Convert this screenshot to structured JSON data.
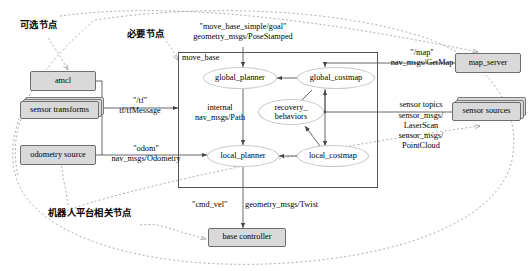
{
  "diagram": {
    "colors": {
      "node_fill": "#d9d9d9",
      "node_border": "#6e6e6e",
      "ellipse_border": "#c9c9c9",
      "line": "#555555",
      "dashed": "#9a9a9a"
    }
  },
  "annotations": {
    "optional_nodes": "可选节点",
    "required_nodes": "必要节点",
    "platform_nodes": "机器人平台相关节点"
  },
  "container": {
    "label": "move_base"
  },
  "nodes": {
    "amcl": "amcl",
    "sensor_transforms": "sensor transforms",
    "odometry_source": "odometry source",
    "map_server": "map_server",
    "sensor_sources": "sensor sources",
    "base_controller": "base controller"
  },
  "components": {
    "global_planner": "global_planner",
    "global_costmap": "global_costmap",
    "recovery_behaviors": "recovery_\nbehaviors",
    "recovery_behaviors_l1": "recovery_",
    "recovery_behaviors_l2": "behaviors",
    "local_planner": "local_planner",
    "local_costmap": "local_costmap"
  },
  "topics": {
    "goal_name": "\"move_base_simple/goal\"",
    "goal_type": "geometry_msgs/PoseStamped",
    "tf_name": "\"/tf\"",
    "tf_type": "tf/tfMessage",
    "odom_name": "\"odom\"",
    "odom_type": "nav_msgs/Odometry",
    "internal_name": "internal",
    "internal_type": "nav_msgs/Path",
    "map_name": "\"/map\"",
    "map_type": "nav_msgs/GetMap",
    "sensor_name": "sensor topics",
    "sensor_type_1": "sensor_msgs/",
    "sensor_type_2": "LaserScan",
    "sensor_type_3": "sensor_msgs/",
    "sensor_type_4": "PointCloud",
    "cmd_vel_name": "\"cmd_vel\"",
    "cmd_vel_type": "geometry_msgs/Twist"
  }
}
